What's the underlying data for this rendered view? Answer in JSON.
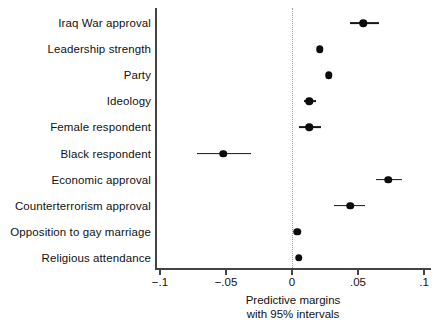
{
  "chart_data": {
    "type": "scatter",
    "title": "",
    "subtitle": "",
    "xlabel_lines": [
      "Predictive margins",
      "with 95% intervals"
    ],
    "ylabel": "",
    "orientation": "horizontal",
    "grid": false,
    "legend": "none",
    "zero_reference_line": 0,
    "xlim": [
      -0.1,
      0.1
    ],
    "xticks": [
      -0.1,
      -0.05,
      0,
      0.05,
      0.1
    ],
    "xtick_labels": [
      "−.1",
      "−.05",
      "0",
      ".05",
      ".1"
    ],
    "categories": [
      "Iraq War approval",
      "Leadership strength",
      "Party",
      "Ideology",
      "Female respondent",
      "Black respondent",
      "Economic approval",
      "Counterterrorism approval",
      "Opposition to gay marriage",
      "Religious attendance"
    ],
    "values": [
      0.054,
      0.021,
      0.028,
      0.013,
      0.013,
      -0.052,
      0.073,
      0.044,
      0.004,
      0.005
    ],
    "ci_low": [
      0.044,
      0.021,
      0.028,
      0.009,
      0.005,
      -0.072,
      0.064,
      0.032,
      0.004,
      0.004
    ],
    "ci_high": [
      0.066,
      0.021,
      0.028,
      0.018,
      0.022,
      -0.031,
      0.083,
      0.055,
      0.005,
      0.006
    ],
    "points": [
      {
        "label": "Iraq War approval",
        "value": 0.054,
        "ci_low": 0.044,
        "ci_high": 0.066
      },
      {
        "label": "Leadership strength",
        "value": 0.021,
        "ci_low": 0.021,
        "ci_high": 0.021
      },
      {
        "label": "Party",
        "value": 0.028,
        "ci_low": 0.028,
        "ci_high": 0.028
      },
      {
        "label": "Ideology",
        "value": 0.013,
        "ci_low": 0.009,
        "ci_high": 0.018
      },
      {
        "label": "Female respondent",
        "value": 0.013,
        "ci_low": 0.005,
        "ci_high": 0.022
      },
      {
        "label": "Black respondent",
        "value": -0.052,
        "ci_low": -0.072,
        "ci_high": -0.031
      },
      {
        "label": "Economic approval",
        "value": 0.073,
        "ci_low": 0.064,
        "ci_high": 0.083
      },
      {
        "label": "Counterterrorism approval",
        "value": 0.044,
        "ci_low": 0.032,
        "ci_high": 0.055
      },
      {
        "label": "Opposition to gay marriage",
        "value": 0.004,
        "ci_low": 0.004,
        "ci_high": 0.005
      },
      {
        "label": "Religious attendance",
        "value": 0.005,
        "ci_low": 0.004,
        "ci_high": 0.006
      }
    ]
  }
}
